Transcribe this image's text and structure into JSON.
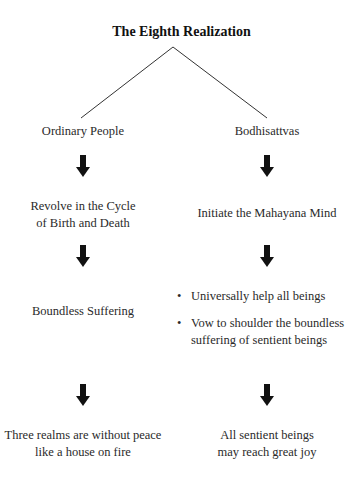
{
  "title": "The Eighth Realization",
  "branches": {
    "left": {
      "heading": "Ordinary People",
      "steps": [
        "Revolve in the Cycle\nof Birth and Death",
        "Boundless Suffering",
        "Three realms are without peace\nlike a house on fire"
      ],
      "step_lines": [
        [
          "Revolve in the Cycle",
          "of Birth and Death"
        ],
        [
          "Boundless Suffering"
        ],
        [
          "Three realms are without peace",
          "like a house on fire"
        ]
      ]
    },
    "right": {
      "heading": "Bodhisattvas",
      "step_lines": [
        [
          "Initiate the Mahayana Mind"
        ],
        [
          "All sentient beings",
          "may reach great joy"
        ]
      ],
      "bullets": [
        {
          "marker": "•",
          "lines": [
            "Universally help all beings"
          ]
        },
        {
          "marker": "•",
          "lines": [
            "Vow to shoulder the boundless",
            "suffering of sentient beings"
          ]
        }
      ]
    }
  },
  "colors": {
    "line": "#333333",
    "arrow": "#111111",
    "text": "#2a2a2a"
  },
  "icons": {
    "arrow": "down-arrow-icon"
  }
}
